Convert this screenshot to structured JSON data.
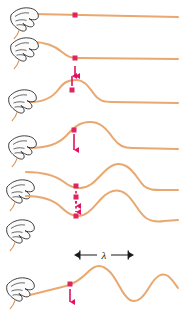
{
  "figure": {
    "type": "physics-diagram",
    "background_color": "#ffffff",
    "rope_color": "#e8a870",
    "rope_color_dark": "#d98f52",
    "marker_color": "#e0245e",
    "arrow_color": "#e0115f",
    "annotation_color": "#1a1a1a",
    "hand_outline_color": "#2b2b2b",
    "hand_fill_color": "#fbfbfb",
    "panel_count": 7
  },
  "annotations": {
    "wavelength_symbol": "λ",
    "wavelength_label_x": 103,
    "wavelength_label_y": 257,
    "bracket_left_x": 80,
    "bracket_right_x": 128,
    "bracket_y": 255
  },
  "panels": [
    {
      "index": 1,
      "name": "rope-at-rest",
      "baseline_y": 15,
      "hand_x": 10,
      "hand_y": 6,
      "marker": {
        "x": 75,
        "y": 15,
        "label": "rope-marker-dot"
      },
      "arrow": {
        "present": false,
        "direction": "none",
        "style": "none"
      },
      "rope_path": "M 33 14 L 178 17"
    },
    {
      "index": 2,
      "name": "hand-moves-up-pulse-starts",
      "baseline_y": 58,
      "hand_x": 10,
      "hand_y": 36,
      "marker": {
        "x": 75,
        "y": 58,
        "label": "rope-marker-dot"
      },
      "arrow": {
        "present": true,
        "direction": "down",
        "style": "solid",
        "x": 75,
        "from_y": 64,
        "to_y": 76
      },
      "rope_path": "M 32 42 C 45 42 54 45 62 52 C 68 57 71 58 78 58 L 178 59"
    },
    {
      "index": 3,
      "name": "pulse-travels-marker-rises",
      "baseline_y": 102,
      "hand_x": 8,
      "hand_y": 88,
      "marker": {
        "x": 72,
        "y": 90,
        "label": "rope-marker-dot"
      },
      "arrow": {
        "present": true,
        "direction": "up",
        "style": "solid",
        "x": 72,
        "from_y": 87,
        "to_y": 75
      },
      "rope_path": "M 30 102 C 44 102 52 98 58 90 C 64 82 68 80 76 80 C 84 80 88 86 94 94 C 99 101 104 102 112 102 L 178 103"
    },
    {
      "index": 4,
      "name": "marker-at-crest-moving-down",
      "baseline_y": 148,
      "hand_x": 8,
      "hand_y": 134,
      "marker": {
        "x": 74,
        "y": 130,
        "label": "rope-marker-dot"
      },
      "arrow": {
        "present": true,
        "direction": "down",
        "style": "solid",
        "x": 74,
        "from_y": 134,
        "to_y": 150
      },
      "rope_path": "M 28 148 C 48 148 58 144 66 136 C 74 127 80 122 90 122 C 100 122 106 128 113 138 C 119 146 124 148 132 148 L 178 149"
    },
    {
      "index": 5,
      "name": "marker-descending-dashed-arrow",
      "baseline_y": 190,
      "hand_x": 6,
      "hand_y": 178,
      "marker": {
        "x": 76,
        "y": 186,
        "label": "rope-marker-dot"
      },
      "arrow": {
        "present": true,
        "direction": "down",
        "style": "dashed",
        "x": 76,
        "from_y": 190,
        "to_y": 206
      },
      "rope_path": "M 26 172 C 44 172 56 176 64 182 C 70 187 74 188 80 188 C 90 188 96 180 104 172 C 112 164 118 162 126 166 C 134 170 138 180 144 186 C 149 190 154 190 160 190 L 178 190"
    },
    {
      "index": 6,
      "name": "marker-at-trough-dashed-arrow",
      "baseline_y": 232,
      "hand_x": 6,
      "hand_y": 218,
      "marker": {
        "x": 76,
        "y": 212,
        "label": "rope-marker-dot"
      },
      "arrow": {
        "present": true,
        "direction": "down",
        "style": "dashed",
        "x": 76,
        "from_y": 195,
        "to_y": 214
      },
      "rope_path": "M 26 196 C 42 196 54 200 62 208 C 68 214 72 216 78 216 C 88 216 94 206 102 198 C 110 190 118 188 126 194 C 134 200 138 212 146 218 C 152 222 158 222 164 221 L 178 220"
    },
    {
      "index": 7,
      "name": "continuous-wave-train",
      "baseline_y": 295,
      "hand_x": 6,
      "hand_y": 276,
      "marker": {
        "x": 70,
        "y": 284,
        "label": "rope-marker-dot"
      },
      "arrow": {
        "present": true,
        "direction": "down",
        "style": "solid",
        "x": 70,
        "from_y": 288,
        "to_y": 302
      },
      "rope_path": "M 26 296 L 66 286 C 74 284 80 280 88 272 C 96 264 102 264 110 272 C 118 280 122 296 130 300 C 138 304 144 296 150 286 C 156 276 162 272 168 276 C 172 279 175 284 178 288"
    }
  ]
}
